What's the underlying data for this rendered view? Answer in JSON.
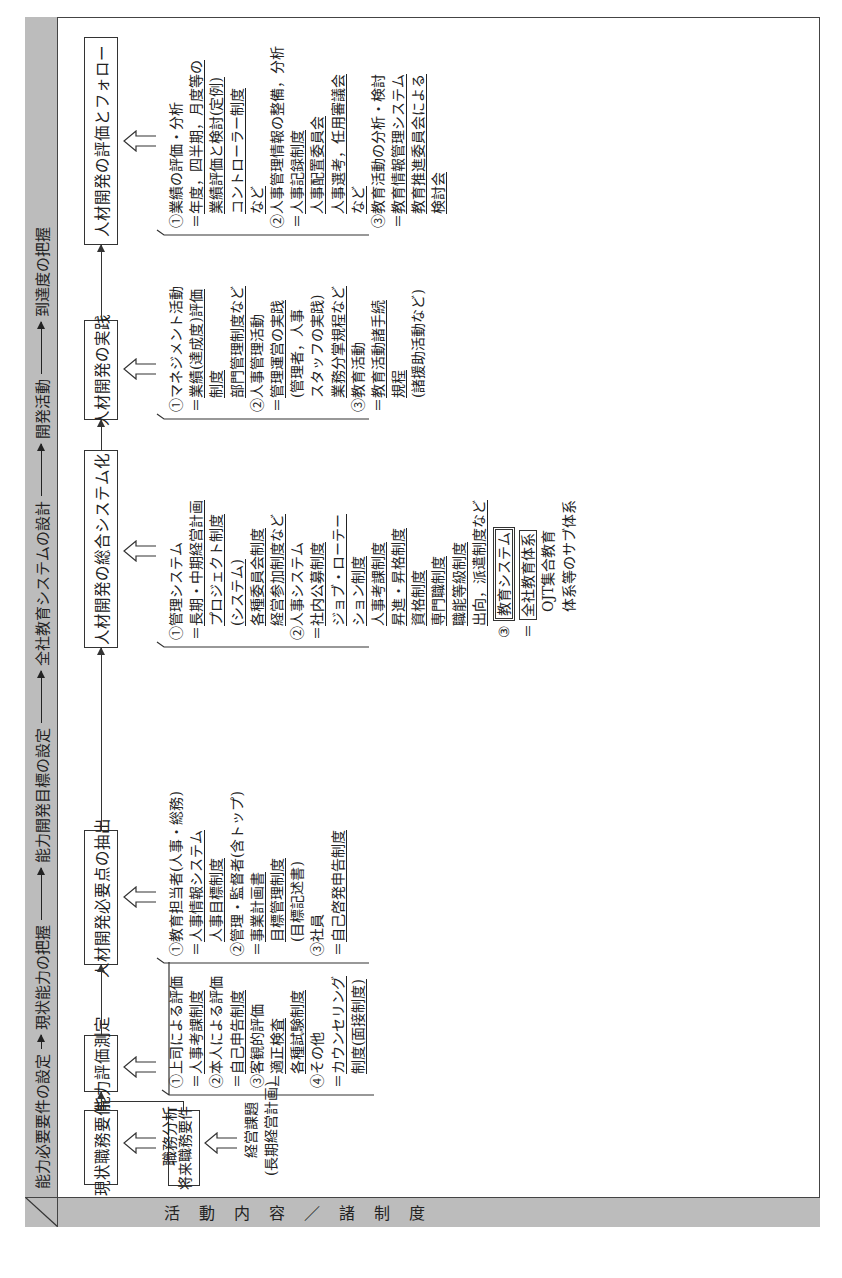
{
  "header": {
    "stages": [
      "能力必要要件の設定",
      "現状能力の把握",
      "能力開発目標の設定",
      "全社教育システムの設計",
      "開発活動",
      "到達度の把握"
    ]
  },
  "side_label": [
    "活",
    "動",
    "内",
    "容",
    "／",
    "諸",
    "制",
    "度"
  ],
  "boxes": {
    "current_job": "現状職務要件",
    "future_job": "将来職務要件",
    "ability_eval": "能力評価測定",
    "extract_needs": "人材開発必要点の抽出",
    "systemize": "人材開発の総合システム化",
    "practice": "人材開発の実践",
    "evaluate_follow": "人材開発の評価とフォロー"
  },
  "inputs": {
    "current_job_source": "職務分析",
    "future_job_source": [
      "経営課題",
      "(長期経営計画)"
    ]
  },
  "lists": {
    "ability_eval": [
      {
        "t": "①上司による評価",
        "u": false
      },
      {
        "t": "＝人事考課制度",
        "u": true,
        "p": "＝"
      },
      {
        "t": "②本人による評価",
        "u": false
      },
      {
        "t": "＝自己申告制度",
        "u": true,
        "p": "＝"
      },
      {
        "t": "③客観的評価",
        "u": false
      },
      {
        "t": "＝適正検査",
        "u": true,
        "p": "＝"
      },
      {
        "t": "　各種試験制度",
        "u": true,
        "p": "　"
      },
      {
        "t": "④その他",
        "u": false
      },
      {
        "t": "＝カウンセリング",
        "u": true,
        "p": "＝"
      },
      {
        "t": "　制度(面接制度)",
        "u": true,
        "p": "　"
      }
    ],
    "extract_needs": [
      {
        "t": "①教育担当者(人事・総務)",
        "u": false
      },
      {
        "t": "＝人事情報システム",
        "u": true,
        "p": "＝"
      },
      {
        "t": "　人事目標制度",
        "u": true,
        "p": "　"
      },
      {
        "t": "②管理・監督者(含トップ)",
        "u": false
      },
      {
        "t": "＝事業計画書",
        "u": true,
        "p": "＝"
      },
      {
        "t": "　目標管理制度",
        "u": true,
        "p": "　"
      },
      {
        "t": "　(目標記述書)",
        "u": false
      },
      {
        "t": "③社員",
        "u": false
      },
      {
        "t": "＝自己啓発申告制度",
        "u": true,
        "p": "＝"
      }
    ],
    "systemize": [
      {
        "t": "①管理システム",
        "u": false
      },
      {
        "t": "＝長期・中期経営計画",
        "u": true,
        "p": "＝"
      },
      {
        "t": "　プロジェクト制度",
        "u": true,
        "p": "　"
      },
      {
        "t": "　(システム)",
        "u": true,
        "p": "　"
      },
      {
        "t": "　各種委員会制度",
        "u": true,
        "p": "　"
      },
      {
        "t": "　経営参加制度など",
        "u": true,
        "p": "　"
      },
      {
        "t": "②人事システム",
        "u": false
      },
      {
        "t": "＝社内公募制度",
        "u": true,
        "p": "＝"
      },
      {
        "t": "　ジョブ・ローテー",
        "u": true,
        "p": "　"
      },
      {
        "t": "　ション制度",
        "u": true,
        "p": "　"
      },
      {
        "t": "　人事考課制度",
        "u": true,
        "p": "　"
      },
      {
        "t": "　昇進・昇格制度",
        "u": true,
        "p": "　"
      },
      {
        "t": "　資格制度",
        "u": true,
        "p": "　"
      },
      {
        "t": "　専門職制度",
        "u": true,
        "p": "　"
      },
      {
        "t": "　職能等級制度",
        "u": true,
        "p": "　"
      },
      {
        "t": "　出向，派遣制度など",
        "u": true,
        "p": "　"
      }
    ],
    "education_system": {
      "num": "③",
      "title": "教育システム",
      "eq": "＝",
      "items": [
        "全社教育体系",
        "OJT集合教育",
        "体系等のサブ体系"
      ]
    },
    "practice": [
      {
        "t": "①マネジメント活動",
        "u": false
      },
      {
        "t": "＝業績(達成度)評価",
        "u": true,
        "p": "＝"
      },
      {
        "t": "　制度",
        "u": true,
        "p": "　"
      },
      {
        "t": "　部門管理制度など",
        "u": true,
        "p": "　"
      },
      {
        "t": "②人事管理活動",
        "u": false
      },
      {
        "t": "＝管理運営の実践",
        "u": true,
        "p": "＝"
      },
      {
        "t": "　(管理者，人事",
        "u": false
      },
      {
        "t": "　スタッフの実践)",
        "u": false
      },
      {
        "t": "　業務分掌規程など",
        "u": true,
        "p": "　"
      },
      {
        "t": "③教育活動",
        "u": false
      },
      {
        "t": "＝教育活動諸手続",
        "u": true,
        "p": "＝"
      },
      {
        "t": "　規程",
        "u": true,
        "p": "　"
      },
      {
        "t": "　(諸援助活動など)",
        "u": false
      }
    ],
    "evaluate_follow": [
      {
        "t": "①業績の評価・分析",
        "u": false
      },
      {
        "t": "＝年度，四半期，月度等の",
        "u": true,
        "p": "＝"
      },
      {
        "t": "　業績評価と検討(定例)",
        "u": true,
        "p": "　"
      },
      {
        "t": "　コントローラー制度",
        "u": true,
        "p": "　"
      },
      {
        "t": "　など",
        "u": true,
        "p": "　"
      },
      {
        "t": "②人事管理情報の整備，分析",
        "u": false
      },
      {
        "t": "＝人事記録制度",
        "u": true,
        "p": "＝"
      },
      {
        "t": "　人事配置委員会",
        "u": true,
        "p": "　"
      },
      {
        "t": "　人事選考，任用審議会",
        "u": true,
        "p": "　"
      },
      {
        "t": "　など",
        "u": true,
        "p": "　"
      },
      {
        "t": "③教育活動の分析・検討",
        "u": false
      },
      {
        "t": "＝教育情報管理システム",
        "u": true,
        "p": "＝"
      },
      {
        "t": "　教育推進委員会による",
        "u": true,
        "p": "　"
      },
      {
        "t": "　検討会",
        "u": true,
        "p": "　"
      }
    ]
  },
  "colors": {
    "strip": "#bcbcbc",
    "line": "#333333",
    "background": "#ffffff"
  }
}
